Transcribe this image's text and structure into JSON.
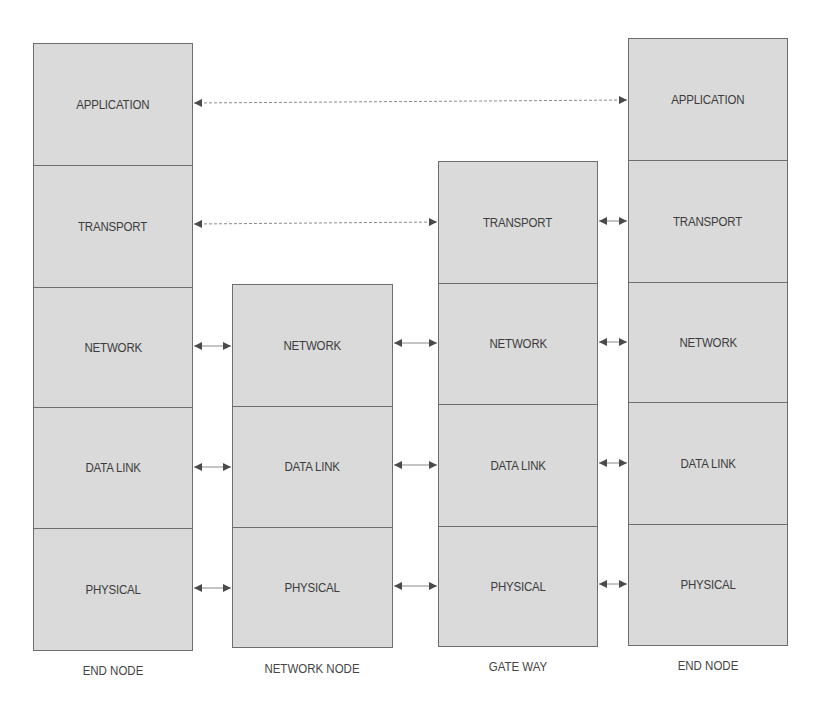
{
  "diagram": {
    "colors": {
      "layer_fill": "#dadada",
      "layer_border": "#6e6e6e",
      "text": "#3c3c3c",
      "arrow": "#555555"
    },
    "nodes": [
      {
        "id": "end-node-left",
        "label": "END NODE",
        "layers": [
          "APPLICATION",
          "TRANSPORT",
          "NETWORK",
          "DATA LINK",
          "PHYSICAL"
        ]
      },
      {
        "id": "network-node",
        "label": "NETWORK NODE",
        "layers": [
          "NETWORK",
          "DATA LINK",
          "PHYSICAL"
        ]
      },
      {
        "id": "gateway",
        "label": "GATE WAY",
        "layers": [
          "TRANSPORT",
          "NETWORK",
          "DATA LINK",
          "PHYSICAL"
        ]
      },
      {
        "id": "end-node-right",
        "label": "END NODE",
        "layers": [
          "APPLICATION",
          "TRANSPORT",
          "NETWORK",
          "DATA LINK",
          "PHYSICAL"
        ]
      }
    ],
    "connections": [
      {
        "from": "END NODE (left).APPLICATION",
        "to": "END NODE (right).APPLICATION",
        "style": "dashed"
      },
      {
        "from": "END NODE (left).TRANSPORT",
        "to": "GATE WAY.TRANSPORT",
        "style": "dashed"
      },
      {
        "from": "GATE WAY.TRANSPORT",
        "to": "END NODE (right).TRANSPORT",
        "style": "short"
      },
      {
        "from": "END NODE (left).NETWORK",
        "to": "NETWORK NODE.NETWORK",
        "style": "short"
      },
      {
        "from": "NETWORK NODE.NETWORK",
        "to": "GATE WAY.NETWORK",
        "style": "short"
      },
      {
        "from": "GATE WAY.NETWORK",
        "to": "END NODE (right).NETWORK",
        "style": "short"
      },
      {
        "from": "END NODE (left).DATA LINK",
        "to": "NETWORK NODE.DATA LINK",
        "style": "short"
      },
      {
        "from": "NETWORK NODE.DATA LINK",
        "to": "GATE WAY.DATA LINK",
        "style": "short"
      },
      {
        "from": "GATE WAY.DATA LINK",
        "to": "END NODE (right).DATA LINK",
        "style": "short"
      },
      {
        "from": "END NODE (left).PHYSICAL",
        "to": "NETWORK NODE.PHYSICAL",
        "style": "short"
      },
      {
        "from": "NETWORK NODE.PHYSICAL",
        "to": "GATE WAY.PHYSICAL",
        "style": "short"
      },
      {
        "from": "GATE WAY.PHYSICAL",
        "to": "END NODE (right).PHYSICAL",
        "style": "short"
      }
    ]
  }
}
